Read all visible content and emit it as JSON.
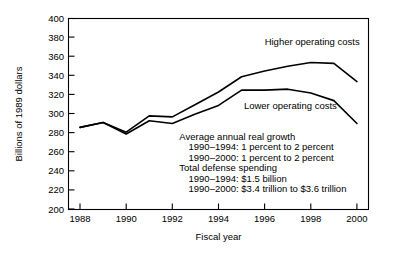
{
  "chart_data": {
    "type": "line",
    "title": "",
    "xlabel": "Fiscal year",
    "ylabel": "Billions of 1989 dollars",
    "xlim": [
      1987.5,
      2000.5
    ],
    "ylim": [
      200,
      400
    ],
    "grid": false,
    "legend_position": "inline-labels",
    "x_tick_labels": [
      "1988",
      "1990",
      "1992",
      "1994",
      "1996",
      "1998",
      "2000"
    ],
    "x_ticks": [
      1988,
      1990,
      1992,
      1994,
      1996,
      1998,
      2000
    ],
    "y_tick_labels": [
      "200",
      "220",
      "240",
      "260",
      "280",
      "300",
      "320",
      "340",
      "360",
      "380",
      "400"
    ],
    "y_ticks": [
      200,
      220,
      240,
      260,
      280,
      300,
      320,
      340,
      360,
      380,
      400
    ],
    "x": [
      1988,
      1989,
      1990,
      1991,
      1992,
      1993,
      1994,
      1995,
      1996,
      1997,
      1998,
      1999,
      2000
    ],
    "series": [
      {
        "name": "Higher operating costs",
        "values": [
          286,
          291,
          281,
          298,
          297,
          310,
          323,
          339,
          345,
          350,
          354,
          353,
          334
        ]
      },
      {
        "name": "Lower operating costs",
        "values": [
          286,
          291,
          279,
          293,
          290,
          300,
          309,
          325,
          325,
          326,
          322,
          314,
          290
        ]
      }
    ],
    "annotations": [
      {
        "name": "higher-operating-costs-label",
        "text": "Higher operating costs",
        "x": 1996.0,
        "y": 372
      },
      {
        "name": "lower-operating-costs-label",
        "text": "Lower operating costs",
        "x": 1995.1,
        "y": 305
      },
      {
        "name": "note-line-1",
        "text": "Average annual real growth",
        "x": 1992.3,
        "y": 273
      },
      {
        "name": "note-line-2",
        "text": "1990–1994: 1 percent to 2 percent",
        "x": 1992.7,
        "y": 262
      },
      {
        "name": "note-line-3",
        "text": "1990–2000: 1 percent to 2 percent",
        "x": 1992.7,
        "y": 251
      },
      {
        "name": "note-line-4",
        "text": "Total defense spending",
        "x": 1992.3,
        "y": 240
      },
      {
        "name": "note-line-5",
        "text": "1990–1994: $1.5 billion",
        "x": 1992.7,
        "y": 229
      },
      {
        "name": "note-line-6",
        "text": "1990–2000: $3.4 trillion to $3.6 trillion",
        "x": 1992.7,
        "y": 218
      }
    ],
    "colors": {
      "line": "#000000",
      "axis": "#000000",
      "background": "#ffffff",
      "text": "#000000"
    }
  }
}
